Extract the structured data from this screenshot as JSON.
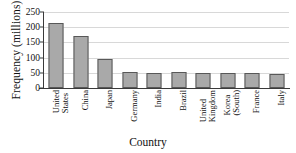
{
  "chart_data": {
    "type": "bar",
    "title": "",
    "xlabel": "Country",
    "ylabel": "Frequency (millions)",
    "categories": [
      "United States",
      "China",
      "Japan",
      "Germany",
      "India",
      "Brazil",
      "United Kingdom",
      "Korea (South)",
      "France",
      "Italy"
    ],
    "category_lines": [
      [
        "United",
        "States"
      ],
      [
        "China"
      ],
      [
        "Japan"
      ],
      [
        "Germany"
      ],
      [
        "India"
      ],
      [
        "Brazil"
      ],
      [
        "United",
        "Kingdom"
      ],
      [
        "Korea",
        "(South)"
      ],
      [
        "France"
      ],
      [
        "Italy"
      ]
    ],
    "values": [
      215,
      170,
      95,
      54,
      51,
      52,
      50,
      48,
      49,
      45
    ],
    "ylim": [
      0,
      250
    ],
    "yticks": [
      0,
      50,
      100,
      150,
      200,
      250
    ],
    "ytick_labels": [
      "0",
      "50",
      "100",
      "150",
      "200",
      "250"
    ],
    "grid": true,
    "legend": false,
    "bar_color": "#a9a9a9",
    "bar_edge_color": "#585858",
    "grid_color": "#d8d8d8",
    "axis_color": "#3a3a3a"
  }
}
